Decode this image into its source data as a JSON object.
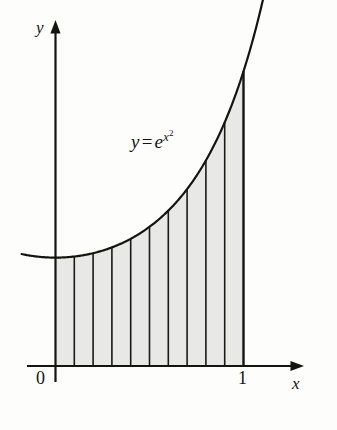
{
  "figure": {
    "background_color": "#fdfdfc",
    "ink_color": "#15150f",
    "shade_color": "#e8e8e6",
    "axes": {
      "y_label": "y",
      "x_label": "x",
      "origin_label": "0",
      "x_tick_label": "1"
    },
    "curve_label": {
      "lhs": "y",
      "equals": "=",
      "base": "e",
      "exponent_base": "x",
      "exponent_power": "2"
    }
  },
  "chart_data": {
    "type": "area",
    "title": "",
    "subtitle": "",
    "xlabel": "x",
    "ylabel": "y",
    "function": "y = e^(x^2)",
    "legend": [],
    "legend_position": "none",
    "grid": false,
    "xlim": [
      -0.18,
      1.32
    ],
    "ylim": [
      0,
      3.1
    ],
    "annotations": [
      {
        "text": "y = e^(x^2)",
        "x": 0.42,
        "y": 2.1
      }
    ],
    "tick_labels": {
      "x": [
        "0",
        "1"
      ],
      "y": []
    },
    "shaded_region": {
      "x_start": 0,
      "x_end": 1,
      "fill": "#e8e8e6",
      "outline": true
    },
    "partition": {
      "n_strips": 10,
      "strip_width": 0.1,
      "x_dividers": [
        0,
        0.1,
        0.2,
        0.3,
        0.4,
        0.5,
        0.6,
        0.7,
        0.8,
        0.9,
        1.0
      ]
    },
    "x": [
      0,
      0.1,
      0.2,
      0.3,
      0.4,
      0.5,
      0.6,
      0.7,
      0.8,
      0.9,
      1.0
    ],
    "values": [
      1,
      1.01,
      1.041,
      1.094,
      1.174,
      1.284,
      1.433,
      1.632,
      1.896,
      2.248,
      2.718
    ],
    "curve_extent": {
      "x_min": -0.18,
      "x_max": 1.12,
      "note": "curve drawn slightly beyond the shaded interval on both sides"
    }
  }
}
